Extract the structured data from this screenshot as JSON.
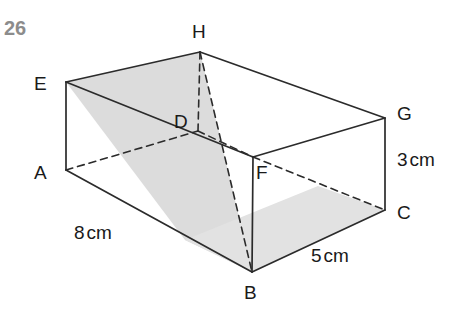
{
  "question": {
    "number": "26"
  },
  "figure": {
    "kind": "cuboid-with-shaded-plane",
    "colors": {
      "stroke": "#2b2b2b",
      "shade_fill": "#dcdcdc",
      "shade_fill_light": "#e9e9e9",
      "background": "#ffffff",
      "number_color": "#8c8c8c",
      "label_color": "#1a1a1a"
    },
    "vertices": [
      {
        "name": "A",
        "x": 66,
        "y": 170,
        "label_x": 34,
        "label_y": 163,
        "hidden_corner": false
      },
      {
        "name": "B",
        "x": 252,
        "y": 272,
        "label_x": 244,
        "label_y": 283,
        "hidden_corner": false
      },
      {
        "name": "C",
        "x": 385,
        "y": 210,
        "label_x": 397,
        "label_y": 203,
        "hidden_corner": false
      },
      {
        "name": "D",
        "x": 198,
        "y": 131,
        "label_x": 174,
        "label_y": 112,
        "hidden_corner": true
      },
      {
        "name": "E",
        "x": 66,
        "y": 82,
        "label_x": 34,
        "label_y": 74,
        "hidden_corner": false
      },
      {
        "name": "F",
        "x": 253,
        "y": 157,
        "label_x": 256,
        "label_y": 163,
        "hidden_corner": false
      },
      {
        "name": "G",
        "x": 385,
        "y": 118,
        "label_x": 397,
        "label_y": 104,
        "hidden_corner": false
      },
      {
        "name": "H",
        "x": 200,
        "y": 52,
        "label_x": 192,
        "label_y": 22,
        "hidden_corner": false
      }
    ],
    "solid_edges": [
      {
        "from": "E",
        "to": "A",
        "name": "edge-EA"
      },
      {
        "from": "E",
        "to": "H",
        "name": "edge-EH"
      },
      {
        "from": "E",
        "to": "F",
        "name": "edge-EF-diagonal-visible"
      },
      {
        "from": "H",
        "to": "G",
        "name": "edge-HG"
      },
      {
        "from": "G",
        "to": "C",
        "name": "edge-GC"
      },
      {
        "from": "G",
        "to": "F",
        "name": "edge-GF"
      },
      {
        "from": "A",
        "to": "B",
        "name": "edge-AB"
      },
      {
        "from": "B",
        "to": "C",
        "name": "edge-BC"
      },
      {
        "from": "F",
        "to": "B",
        "name": "edge-FB"
      }
    ],
    "dashed_edges": [
      {
        "from": "A",
        "to": "D",
        "name": "hidden-edge-AD"
      },
      {
        "from": "D",
        "to": "F",
        "name": "hidden-edge-DF"
      },
      {
        "from": "D",
        "to": "H",
        "name": "hidden-edge-DH"
      },
      {
        "from": "F",
        "to": "C",
        "name": "hidden-edge-FC"
      },
      {
        "from": "H",
        "to": "B",
        "name": "hidden-line-HB"
      }
    ],
    "shaded_faces": [
      {
        "name": "shaded-plane-EHBA-upper",
        "tone": "#dcdcdc",
        "points": "66,82 200,52 252,272 185,240"
      },
      {
        "name": "shaded-plane-bottom-band",
        "tone": "#e2e2e2",
        "points": "185,240 252,272 385,210 318,186"
      }
    ],
    "dimension_labels": [
      {
        "text": "8",
        "unit": "cm",
        "x": 74,
        "y": 223,
        "name": "dimension-label-8cm"
      },
      {
        "text": "5",
        "unit": "cm",
        "x": 311,
        "y": 246,
        "name": "dimension-label-5cm"
      },
      {
        "text": "3",
        "unit": "cm",
        "x": 397,
        "y": 150,
        "name": "dimension-label-3cm"
      }
    ]
  }
}
